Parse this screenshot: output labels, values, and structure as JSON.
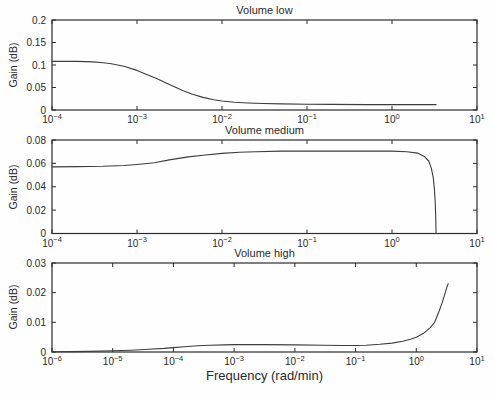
{
  "figure": {
    "background": "#fefefe",
    "axis_color": "#2b2b2b",
    "line_color": "#3d3d3d",
    "text_color": "#2a2a2a"
  },
  "chart_data": [
    {
      "type": "line",
      "title": "Volume low",
      "ylabel": "Gain (dB)",
      "xlabel": "",
      "xscale": "log",
      "grid": false,
      "legend": null,
      "xlim": [
        0.0001,
        10
      ],
      "ylim": [
        0,
        0.2
      ],
      "yticks": [
        0,
        0.05,
        0.1,
        0.15,
        0.2
      ],
      "yticklabels": [
        "0",
        "0.05",
        "0.1",
        "0.15",
        "0.2"
      ],
      "xtick_exponents": [
        -4,
        -3,
        -2,
        -1,
        0,
        1
      ],
      "xticklabels": [
        "10^-4",
        "10^-3",
        "10^-2",
        "10^-1",
        "10^0",
        "10^1"
      ],
      "series": [
        {
          "name": "gain",
          "points": [
            [
              0.0001,
              0.108
            ],
            [
              0.00015,
              0.108
            ],
            [
              0.0002,
              0.108
            ],
            [
              0.0003,
              0.107
            ],
            [
              0.0004,
              0.105
            ],
            [
              0.0005,
              0.103
            ],
            [
              0.0007,
              0.097
            ],
            [
              0.001,
              0.088
            ],
            [
              0.0013,
              0.079
            ],
            [
              0.0017,
              0.07
            ],
            [
              0.0022,
              0.06
            ],
            [
              0.0028,
              0.051
            ],
            [
              0.0035,
              0.043
            ],
            [
              0.0045,
              0.035
            ],
            [
              0.006,
              0.028
            ],
            [
              0.008,
              0.023
            ],
            [
              0.01,
              0.02
            ],
            [
              0.014,
              0.017
            ],
            [
              0.02,
              0.0155
            ],
            [
              0.03,
              0.0145
            ],
            [
              0.05,
              0.0135
            ],
            [
              0.1,
              0.013
            ],
            [
              0.2,
              0.0125
            ],
            [
              0.5,
              0.012
            ],
            [
              1,
              0.012
            ],
            [
              2,
              0.012
            ],
            [
              3.3,
              0.012
            ]
          ]
        }
      ]
    },
    {
      "type": "line",
      "title": "Volume medium",
      "ylabel": "Gain (dB)",
      "xlabel": "",
      "xscale": "log",
      "grid": false,
      "legend": null,
      "xlim": [
        0.0001,
        10
      ],
      "ylim": [
        0,
        0.08
      ],
      "yticks": [
        0,
        0.02,
        0.04,
        0.06,
        0.08
      ],
      "yticklabels": [
        "0",
        "0.02",
        "0.04",
        "0.06",
        "0.08"
      ],
      "xtick_exponents": [
        -4,
        -3,
        -2,
        -1,
        0,
        1
      ],
      "xticklabels": [
        "10^-4",
        "10^-3",
        "10^-2",
        "10^-1",
        "10^0",
        "10^1"
      ],
      "series": [
        {
          "name": "gain",
          "points": [
            [
              0.0001,
              0.057
            ],
            [
              0.0002,
              0.0572
            ],
            [
              0.0004,
              0.0575
            ],
            [
              0.0007,
              0.0582
            ],
            [
              0.001,
              0.059
            ],
            [
              0.0016,
              0.0605
            ],
            [
              0.0024,
              0.063
            ],
            [
              0.004,
              0.0655
            ],
            [
              0.006,
              0.067
            ],
            [
              0.01,
              0.0685
            ],
            [
              0.016,
              0.0695
            ],
            [
              0.025,
              0.07
            ],
            [
              0.05,
              0.0705
            ],
            [
              0.1,
              0.0705
            ],
            [
              0.3,
              0.0705
            ],
            [
              0.6,
              0.0705
            ],
            [
              1,
              0.0705
            ],
            [
              1.5,
              0.07
            ],
            [
              2,
              0.0688
            ],
            [
              2.4,
              0.066
            ],
            [
              2.7,
              0.062
            ],
            [
              2.9,
              0.056
            ],
            [
              3.05,
              0.048
            ],
            [
              3.15,
              0.038
            ],
            [
              3.22,
              0.027
            ],
            [
              3.27,
              0.015
            ],
            [
              3.3,
              0
            ]
          ]
        }
      ]
    },
    {
      "type": "line",
      "title": "Volume high",
      "ylabel": "Gain (dB)",
      "xlabel": "Frequency (rad/min)",
      "xscale": "log",
      "grid": false,
      "legend": null,
      "xlim": [
        1e-06,
        10
      ],
      "ylim": [
        0,
        0.03
      ],
      "yticks": [
        0,
        0.01,
        0.02,
        0.03
      ],
      "yticklabels": [
        "0",
        "0.01",
        "0.02",
        "0.03"
      ],
      "xtick_exponents": [
        -6,
        -5,
        -4,
        -3,
        -2,
        -1,
        0,
        1
      ],
      "xticklabels": [
        "10^-6",
        "10^-5",
        "10^-4",
        "10^-3",
        "10^-2",
        "10^-1",
        "10^0",
        "10^1"
      ],
      "series": [
        {
          "name": "gain",
          "points": [
            [
              1e-06,
              0.0001
            ],
            [
              2e-06,
              0.00015
            ],
            [
              4e-06,
              0.0002
            ],
            [
              1e-05,
              0.0004
            ],
            [
              2e-05,
              0.0006
            ],
            [
              4e-05,
              0.0009
            ],
            [
              7e-05,
              0.0012
            ],
            [
              0.0001,
              0.0015
            ],
            [
              0.00015,
              0.0018
            ],
            [
              0.00025,
              0.0021
            ],
            [
              0.0004,
              0.0023
            ],
            [
              0.0007,
              0.0024
            ],
            [
              0.001,
              0.0025
            ],
            [
              0.003,
              0.0025
            ],
            [
              0.01,
              0.0024
            ],
            [
              0.03,
              0.0023
            ],
            [
              0.06,
              0.0022
            ],
            [
              0.1,
              0.0022
            ],
            [
              0.15,
              0.0023
            ],
            [
              0.25,
              0.0026
            ],
            [
              0.4,
              0.003
            ],
            [
              0.6,
              0.0036
            ],
            [
              0.8,
              0.0043
            ],
            [
              1,
              0.005
            ],
            [
              1.3,
              0.0062
            ],
            [
              1.7,
              0.0082
            ],
            [
              2,
              0.01
            ],
            [
              2.4,
              0.014
            ],
            [
              2.7,
              0.017
            ],
            [
              3,
              0.02
            ],
            [
              3.2,
              0.022
            ],
            [
              3.35,
              0.023
            ]
          ]
        }
      ]
    }
  ]
}
